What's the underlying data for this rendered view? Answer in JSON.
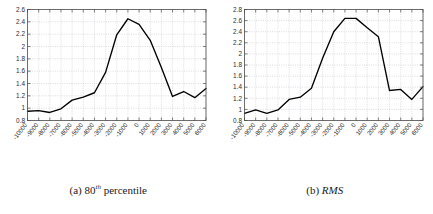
{
  "figure": {
    "panels": [
      {
        "caption_label": "(a)",
        "caption_title": "80",
        "caption_sup": "th",
        "caption_rest": "percentile",
        "caption_italic": false
      },
      {
        "caption_label": "(b)",
        "caption_title": "RMS",
        "caption_sup": "",
        "caption_rest": "",
        "caption_italic": true
      }
    ]
  },
  "style": {
    "line_color": "#000000",
    "grid_color": "#b9b9c4",
    "axis_color": "#4d4d4d",
    "background": "#ffffff"
  },
  "chart_data": [
    {
      "type": "line",
      "title": "(a) 80th percentile",
      "xlabel": "",
      "ylabel": "",
      "xlim": [
        -10000,
        6000
      ],
      "ylim": [
        0.8,
        2.6
      ],
      "grid": true,
      "legend": "none",
      "xticks": [
        -10000,
        -9000,
        -8000,
        -7000,
        -6000,
        -5000,
        -4000,
        -3000,
        -2000,
        -1000,
        0,
        1000,
        2000,
        3000,
        4000,
        5000,
        6000
      ],
      "xtick_labels": [
        "-10000",
        "-9000",
        "-8000",
        "-7000",
        "-6000",
        "-5000",
        "-4000",
        "-3000",
        "-2000",
        "-1000",
        "0",
        "1000",
        "2000",
        "3000",
        "4000",
        "5000",
        "6000"
      ],
      "yticks": [
        0.8,
        1.0,
        1.2,
        1.4,
        1.6,
        1.8,
        2.0,
        2.2,
        2.4,
        2.6
      ],
      "ytick_labels": [
        "0.8",
        "1",
        "1.2",
        "1.4",
        "1.6",
        "1.8",
        "2",
        "2.2",
        "2.4",
        "2.6"
      ],
      "x": [
        -10000,
        -9000,
        -8000,
        -7000,
        -6000,
        -5000,
        -4000,
        -3000,
        -2000,
        -1000,
        0,
        1000,
        2000,
        3000,
        4000,
        5000,
        6000
      ],
      "values": [
        0.95,
        0.96,
        0.93,
        0.99,
        1.13,
        1.18,
        1.25,
        1.58,
        2.19,
        2.45,
        2.36,
        2.1,
        1.66,
        1.19,
        1.27,
        1.17,
        1.32
      ]
    },
    {
      "type": "line",
      "title": "(b) RMS",
      "xlabel": "",
      "ylabel": "",
      "xlim": [
        -10000,
        6000
      ],
      "ylim": [
        0.8,
        2.8
      ],
      "grid": true,
      "legend": "none",
      "xticks": [
        -10000,
        -9000,
        -8000,
        -7000,
        -6000,
        -5000,
        -4000,
        -3000,
        -2000,
        -1000,
        0,
        1000,
        2000,
        3000,
        4000,
        5000,
        6000
      ],
      "xtick_labels": [
        "-10000",
        "-9000",
        "-8000",
        "-7000",
        "-6000",
        "-5000",
        "-4000",
        "-3000",
        "-2000",
        "-1000",
        "0",
        "1000",
        "2000",
        "3000",
        "4000",
        "5000",
        "6000"
      ],
      "yticks": [
        0.8,
        1.0,
        1.2,
        1.4,
        1.6,
        1.8,
        2.0,
        2.2,
        2.4,
        2.6,
        2.8
      ],
      "ytick_labels": [
        "0.8",
        "1",
        "1.2",
        "1.4",
        "1.6",
        "1.8",
        "2",
        "2.2",
        "2.4",
        "2.6",
        "2.8"
      ],
      "x": [
        -10000,
        -9000,
        -8000,
        -7000,
        -6000,
        -5000,
        -4000,
        -3000,
        -2000,
        -1000,
        0,
        1000,
        2000,
        3000,
        4000,
        5000,
        6000
      ],
      "values": [
        0.93,
        0.99,
        0.93,
        0.99,
        1.18,
        1.22,
        1.38,
        1.92,
        2.4,
        2.64,
        2.64,
        2.47,
        2.31,
        1.34,
        1.36,
        1.18,
        1.41
      ]
    }
  ]
}
